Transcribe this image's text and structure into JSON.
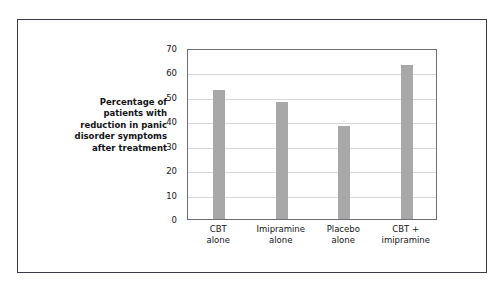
{
  "chart_data": {
    "type": "bar",
    "title": "",
    "xlabel": "",
    "ylabel": "Percentage of patients with reduction in panic disorder symptoms after treatment",
    "ylabel_lines": [
      "Percentage of",
      "patients with",
      "reduction in panic",
      "disorder symptoms",
      "after treatment"
    ],
    "categories": [
      "CBT alone",
      "Imipramine alone",
      "Placebo alone",
      "CBT + imipramine"
    ],
    "category_lines": [
      [
        "CBT",
        "alone"
      ],
      [
        "Imipramine",
        "alone"
      ],
      [
        "Placebo",
        "alone"
      ],
      [
        "CBT +",
        "imipramine"
      ]
    ],
    "values": [
      53,
      48,
      38,
      63
    ],
    "ylim": [
      0,
      70
    ],
    "yticks": [
      70,
      60,
      50,
      40,
      30,
      20,
      10,
      0
    ],
    "grid": true,
    "legend": false,
    "bar_color": "#a8a8a8",
    "frame_color": "#3b3b45",
    "plot_border_color": "#6f6f77",
    "gridline_color": "#d7d7dc",
    "background": "#ffffff"
  }
}
